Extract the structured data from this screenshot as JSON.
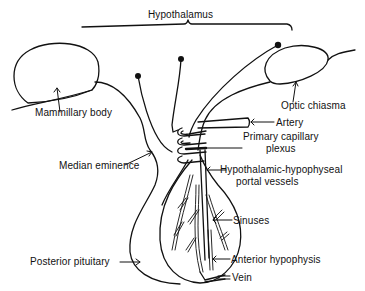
{
  "diagram": {
    "title": "Hypothalamus",
    "labels": {
      "hypothalamus": "Hypothalamus",
      "mammillary_body": "Mammillary body",
      "optic_chiasma": "Optic chiasma",
      "artery": "Artery",
      "primary_capillary_plexus_line1": "Primary capillary",
      "primary_capillary_plexus_line2": "plexus",
      "median_eminence": "Median eminence",
      "portal_vessels_line1": "Hypothalamic-hypophyseal",
      "portal_vessels_line2": "portal vessels",
      "sinuses": "Sinuses",
      "posterior_pituitary": "Posterior pituitary",
      "anterior_hypophysis": "Anterior hypophysis",
      "vein": "Vein"
    },
    "colors": {
      "ink": "#111111",
      "background": "#ffffff"
    }
  }
}
